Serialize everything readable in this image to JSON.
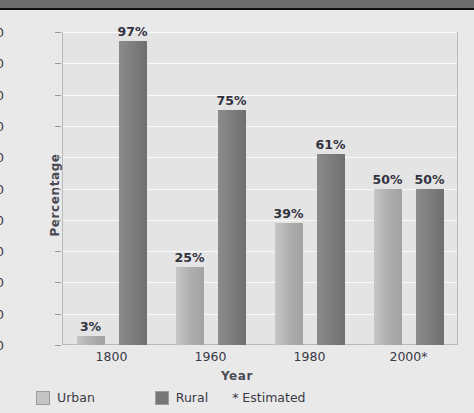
{
  "title_bar": {
    "text": ""
  },
  "chart_data": {
    "type": "bar",
    "title": "",
    "xlabel": "Year",
    "ylabel": "Percentage",
    "categories": [
      "1800",
      "1960",
      "1980",
      "2000*"
    ],
    "series": [
      {
        "name": "Urban",
        "color": "#adadad",
        "values": [
          3,
          25,
          39,
          50
        ],
        "labels": [
          "3%",
          "25%",
          "39%",
          "50%"
        ]
      },
      {
        "name": "Rural",
        "color": "#7c7c7c",
        "values": [
          97,
          75,
          61,
          50
        ],
        "labels": [
          "97%",
          "75%",
          "61%",
          "50%"
        ]
      }
    ],
    "ylim": [
      0,
      100
    ],
    "yticks": [
      "0",
      "10",
      "20",
      "30",
      "40",
      "50",
      "60",
      "70",
      "80",
      "90",
      "100"
    ],
    "grid": true,
    "legend_position": "bottom-left",
    "annotations": [
      "* Estimated"
    ]
  },
  "legend": {
    "urban_label": "Urban",
    "rural_label": "Rural",
    "note": "* Estimated"
  }
}
